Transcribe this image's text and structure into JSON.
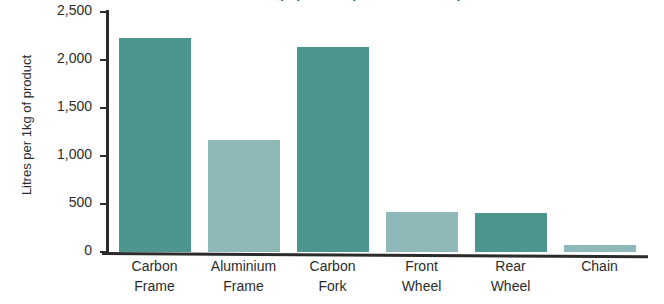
{
  "chart_data": {
    "type": "bar",
    "title": "Water usage per component of a bicycle",
    "xlabel": "",
    "ylabel": "Litres per 1kg of product",
    "categories": [
      "Carbon Frame",
      "Aluminium Frame",
      "Carbon Fork",
      "Front Wheel",
      "Rear Wheel",
      "Chain"
    ],
    "values": [
      2230,
      1165,
      2135,
      415,
      405,
      70
    ],
    "ylim": [
      0,
      2500
    ],
    "ytick_values": [
      0,
      500,
      1000,
      1500,
      2000,
      2500
    ],
    "ytick_labels": [
      "0",
      "500",
      "1,000",
      "1,500",
      "2,000",
      "2,500"
    ],
    "grid": false,
    "legend": "none",
    "bar_colors": [
      "#4d968d",
      "#8fb8b8",
      "#4d968d",
      "#8fb8b8",
      "#4d968d",
      "#8fb8b8"
    ],
    "colors": {
      "dark_teal": "#4d968d",
      "light_teal": "#8fb8b8",
      "axis": "#2b2b2b",
      "background": "#ffffff",
      "title": "#2f6f68"
    }
  }
}
